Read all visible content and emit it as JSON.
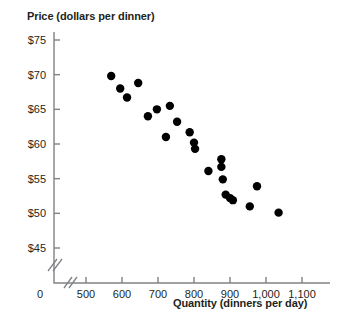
{
  "chart_data": {
    "type": "scatter",
    "title": "",
    "ylabel": "Price (dollars per dinner)",
    "xlabel": "Quantity (dinners per day)",
    "xlim": [
      500,
      1100
    ],
    "ylim": [
      45,
      75
    ],
    "grid": false,
    "legend": null,
    "x_axis_break": true,
    "y_axis_break": true,
    "x_origin_label": "0",
    "xticks": [
      500,
      600,
      700,
      800,
      900,
      1000,
      1100
    ],
    "xtick_labels": [
      "500",
      "600",
      "700",
      "800",
      "900",
      "1,000",
      "1,100"
    ],
    "yticks": [
      45,
      50,
      55,
      60,
      65,
      70,
      75
    ],
    "ytick_labels": [
      "$45",
      "$50",
      "$55",
      "$60",
      "$65",
      "$70",
      "$75"
    ],
    "point_color": "#000000",
    "point_radius": 4.2,
    "points": [
      {
        "x": 570,
        "y": 69.8
      },
      {
        "x": 595,
        "y": 68.0
      },
      {
        "x": 614,
        "y": 66.7
      },
      {
        "x": 645,
        "y": 68.8
      },
      {
        "x": 672,
        "y": 64.0
      },
      {
        "x": 697,
        "y": 65.0
      },
      {
        "x": 733,
        "y": 65.5
      },
      {
        "x": 722,
        "y": 61.0
      },
      {
        "x": 753,
        "y": 63.2
      },
      {
        "x": 788,
        "y": 61.7
      },
      {
        "x": 800,
        "y": 60.2
      },
      {
        "x": 803,
        "y": 59.3
      },
      {
        "x": 840,
        "y": 56.1
      },
      {
        "x": 876,
        "y": 57.8
      },
      {
        "x": 876,
        "y": 56.7
      },
      {
        "x": 880,
        "y": 54.9
      },
      {
        "x": 888,
        "y": 52.7
      },
      {
        "x": 900,
        "y": 52.2
      },
      {
        "x": 908,
        "y": 51.9
      },
      {
        "x": 955,
        "y": 51.0
      },
      {
        "x": 975,
        "y": 53.9
      },
      {
        "x": 1035,
        "y": 50.1
      }
    ]
  }
}
